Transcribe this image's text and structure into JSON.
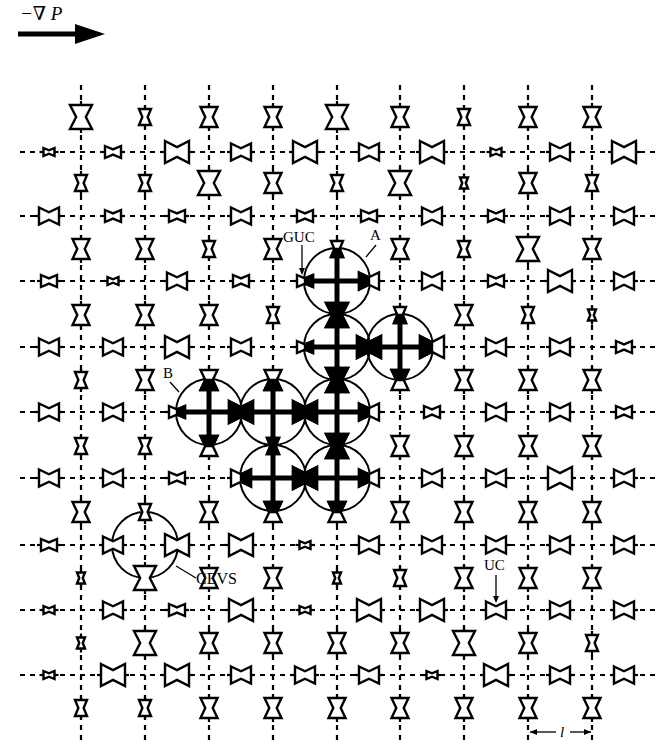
{
  "figure": {
    "pressure_gradient_label": "−∇ P",
    "labels": {
      "guc": "GUC",
      "a": "A",
      "b": "B",
      "cevs": "CEVS",
      "uc": "UC",
      "lattice_spacing": "l"
    },
    "colors": {
      "ink": "#000000",
      "background": "#ffffff"
    },
    "grid": {
      "cols_x": [
        81,
        145,
        209,
        273,
        337,
        400,
        464,
        528,
        592
      ],
      "rows_y": [
        152,
        216,
        281,
        347,
        412,
        478,
        545,
        610,
        675
      ],
      "v_line_top": 85,
      "v_line_bottom": 742,
      "h_line_left": 20,
      "h_line_right": 655
    },
    "vertical_throats": {
      "row_y": [
        117,
        183,
        249,
        315,
        380,
        446,
        512,
        578,
        643,
        708
      ],
      "sizes": [
        [
          "L",
          "S",
          "M",
          "M",
          "L",
          "M",
          "S",
          "M",
          "M"
        ],
        [
          "S",
          "S",
          "L",
          "M",
          "S",
          "L",
          "T",
          "M",
          "S"
        ],
        [
          "M",
          "M",
          "S",
          "M",
          "S",
          "M",
          "S",
          "L",
          "M"
        ],
        [
          "M",
          "M",
          "M",
          "S",
          "L",
          "S",
          "M",
          "S",
          "T"
        ],
        [
          "S",
          "M",
          "M",
          "M",
          "L",
          "M",
          "M",
          "M",
          "M"
        ],
        [
          "S",
          "S",
          "M",
          "S",
          "L",
          "M",
          "M",
          "M",
          "M"
        ],
        [
          "M",
          "S",
          "M",
          "M",
          "M",
          "M",
          "M",
          "M",
          "M"
        ],
        [
          "T",
          "L",
          "M",
          "M",
          "T",
          "S",
          "M",
          "M",
          "M"
        ],
        [
          "T",
          "L",
          "M",
          "M",
          "M",
          "M",
          "L",
          "M",
          "S"
        ],
        [
          "S",
          "S",
          "M",
          "M",
          "M",
          "M",
          "M",
          "M",
          "M"
        ]
      ]
    },
    "horizontal_throats": {
      "col_x": [
        49,
        113,
        177,
        241,
        305,
        369,
        432,
        496,
        560,
        624
      ],
      "sizes": [
        [
          "T",
          "S",
          "L",
          "M",
          "L",
          "M",
          "L",
          "T",
          "M",
          "L"
        ],
        [
          "M",
          "S",
          "S",
          "M",
          "S",
          "S",
          "M",
          "S",
          "M",
          "M"
        ],
        [
          "S",
          "T",
          "M",
          "S",
          "S",
          "M",
          "M",
          "S",
          "L",
          "M"
        ],
        [
          "M",
          "M",
          "L",
          "M",
          "S",
          "L",
          "L",
          "M",
          "M",
          "S"
        ],
        [
          "M",
          "M",
          "S",
          "L",
          "L",
          "M",
          "S",
          "M",
          "M",
          "S"
        ],
        [
          "M",
          "M",
          "S",
          "M",
          "L",
          "M",
          "M",
          "M",
          "L",
          "M"
        ],
        [
          "S",
          "M",
          "L",
          "L",
          "T",
          "M",
          "M",
          "M",
          "M",
          "M"
        ],
        [
          "T",
          "M",
          "S",
          "L",
          "T",
          "L",
          "L",
          "M",
          "M",
          "M"
        ],
        [
          "T",
          "L",
          "L",
          "M",
          "M",
          "M",
          "T",
          "L",
          "M",
          "M"
        ]
      ]
    },
    "invaded_nodes": [
      {
        "col": 4,
        "row": 2
      },
      {
        "col": 4,
        "row": 3
      },
      {
        "col": 5,
        "row": 3
      },
      {
        "col": 2,
        "row": 4
      },
      {
        "col": 3,
        "row": 4
      },
      {
        "col": 4,
        "row": 4
      },
      {
        "col": 3,
        "row": 5
      },
      {
        "col": 4,
        "row": 5
      }
    ],
    "cevs_node": {
      "col": 1,
      "row": 6
    },
    "circle_radius": 33
  }
}
